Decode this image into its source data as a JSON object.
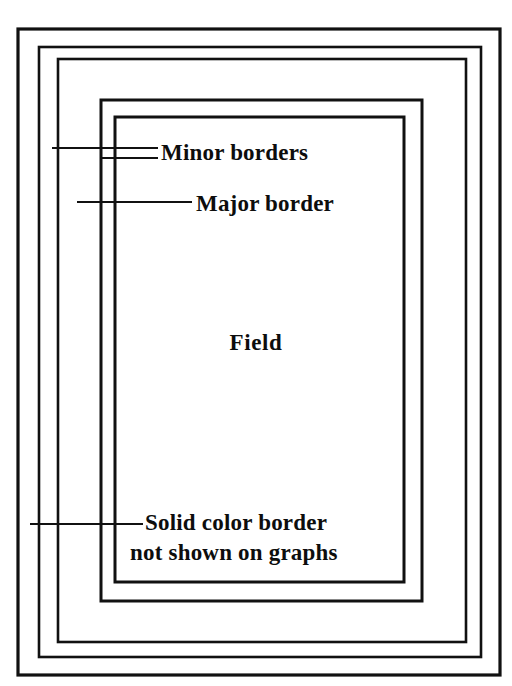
{
  "diagram": {
    "background_color": "#ffffff",
    "line_color": "#111111",
    "text_color": "#0d0d0d",
    "canvas": {
      "width": 512,
      "height": 686
    },
    "rectangles": [
      {
        "name": "solid-color-border-rect",
        "role": "Solid color border",
        "x": 18,
        "y": 29,
        "width": 482,
        "height": 646,
        "stroke_width": 3.2
      },
      {
        "name": "outer-minor-border-rect",
        "role": "Minor border",
        "x": 39,
        "y": 47,
        "width": 442,
        "height": 610,
        "stroke_width": 2.6
      },
      {
        "name": "inner-minor-border-rect",
        "role": "Minor border",
        "x": 58,
        "y": 59,
        "width": 408,
        "height": 583,
        "stroke_width": 2.6
      },
      {
        "name": "major-border-rect",
        "role": "Major border",
        "x": 101,
        "y": 100,
        "width": 321,
        "height": 501,
        "stroke_width": 3.0
      },
      {
        "name": "field-rect",
        "role": "Field",
        "x": 115,
        "y": 117,
        "width": 289,
        "height": 465,
        "stroke_width": 3.0
      }
    ],
    "leader_lines": [
      {
        "name": "leader-minor-border-outer",
        "points_to": "Minor borders",
        "x1": 52,
        "y1": 148,
        "x2": 158,
        "y2": 148,
        "stroke_width": 2.2
      },
      {
        "name": "leader-minor-border-inner",
        "points_to": "Minor borders",
        "x1": 101,
        "y1": 158,
        "x2": 158,
        "y2": 158,
        "stroke_width": 2.2
      },
      {
        "name": "leader-major-border",
        "points_to": "Major border",
        "x1": 77,
        "y1": 202,
        "x2": 192,
        "y2": 202,
        "stroke_width": 2.2
      },
      {
        "name": "leader-solid-color-border",
        "points_to": "Solid color border",
        "x1": 30,
        "y1": 524,
        "x2": 143,
        "y2": 524,
        "stroke_width": 2.2
      }
    ],
    "labels": {
      "minor_borders": "Minor borders",
      "major_border": "Major border",
      "field": "Field",
      "solid_color_border_line1": "Solid color border",
      "solid_color_border_line2": "not shown on graphs"
    }
  }
}
